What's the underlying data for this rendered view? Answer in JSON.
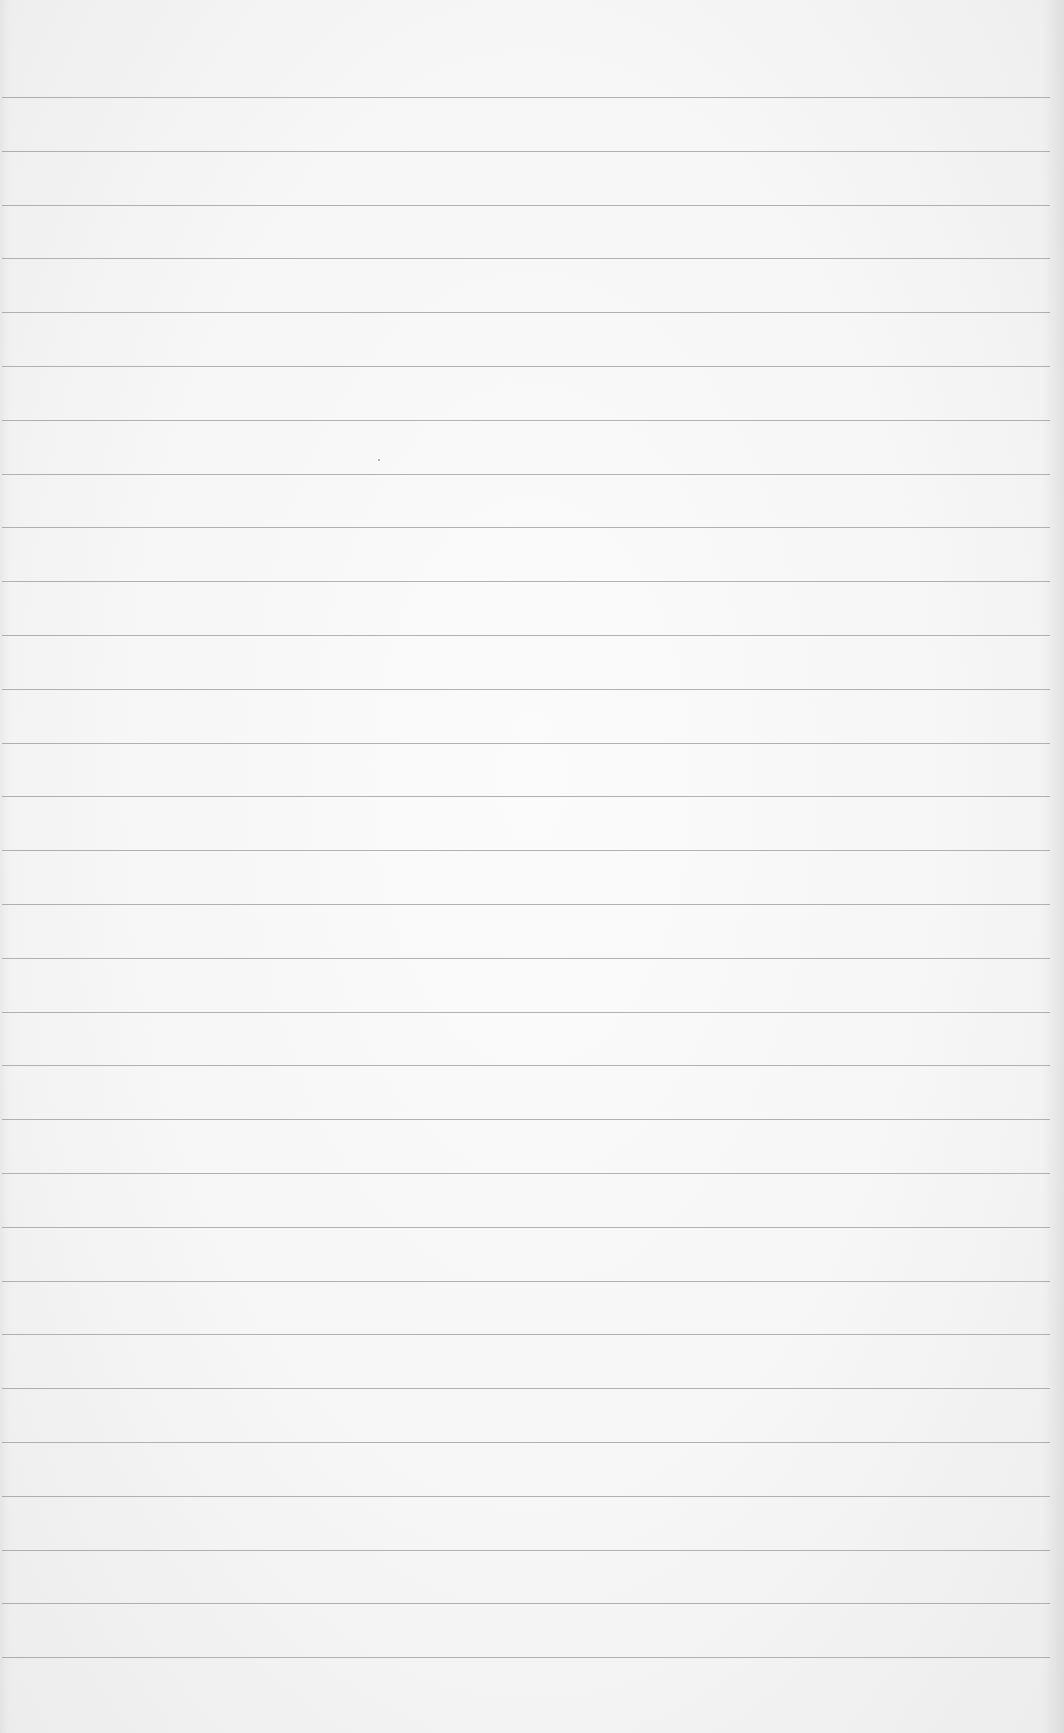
{
  "document": {
    "type": "blank lined paper",
    "text_content": "",
    "ruled_lines": {
      "count": 30,
      "first_y": 97,
      "spacing": 53.8,
      "left_x": 2,
      "right_x": 1050,
      "color": "#9a9a9a"
    },
    "paper_color": "#f6f6f6"
  }
}
